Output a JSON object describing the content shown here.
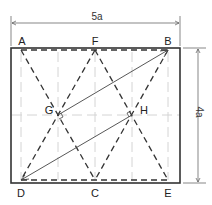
{
  "diagram": {
    "dimensions": {
      "width_label": "5a",
      "height_label": "4a"
    },
    "points": {
      "A": "A",
      "F": "F",
      "B": "B",
      "G": "G",
      "H": "H",
      "D": "D",
      "C": "C",
      "E": "E"
    },
    "colors": {
      "outline": "#333333",
      "dashed": "#333333",
      "guide": "#cccccc",
      "solid_line": "#444444"
    }
  }
}
